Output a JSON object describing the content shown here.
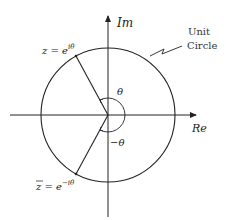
{
  "diagram": {
    "axes": {
      "imaginary_label": "Im",
      "real_label": "Re"
    },
    "circle_label_line1": "Unit",
    "circle_label_line2": "Circle",
    "point_z_label": "z = e^{iθ}",
    "point_z_text": "z = e",
    "point_z_exp": "iθ",
    "point_zbar_text": "z = e",
    "point_zbar_exp": "−iθ",
    "angle_pos": "θ",
    "angle_neg": "−θ",
    "colors": {
      "stroke": "#222222",
      "text": "#222222"
    }
  }
}
